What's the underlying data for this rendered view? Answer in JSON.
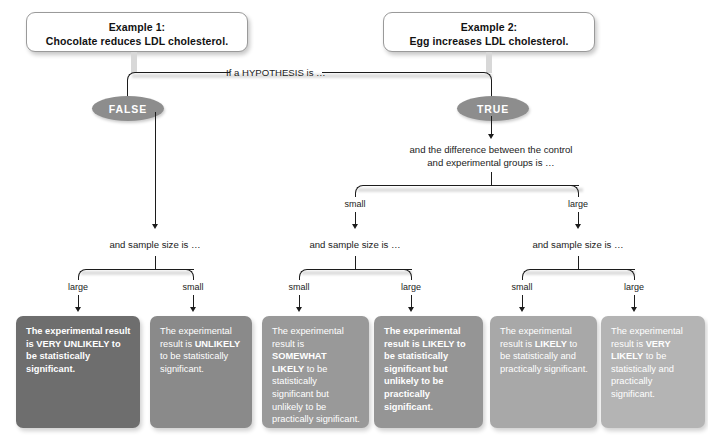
{
  "diagram": {
    "examples": [
      {
        "id": "example-1",
        "line1": "Example 1:",
        "line2": "Chocolate reduces LDL cholesterol."
      },
      {
        "id": "example-2",
        "line1": "Example 2:",
        "line2": "Egg increases LDL cholesterol."
      }
    ],
    "root_question": "If a HYPOTHESIS is …",
    "decisions": [
      {
        "id": "false-node",
        "label": "FALSE",
        "color": "#8d8d8d"
      },
      {
        "id": "true-node",
        "label": "TRUE",
        "color": "#8d8d8d"
      }
    ],
    "difference_question_line1": "and the difference between the control",
    "difference_question_line2": "and experimental groups is …",
    "difference_branches": [
      {
        "id": "difference-small",
        "label": "small"
      },
      {
        "id": "difference-large",
        "label": "large"
      }
    ],
    "sample_size_question": "and sample size is …",
    "sample_size_questions": [
      {
        "id": "sample-size-false",
        "label": "and sample size is …"
      },
      {
        "id": "sample-size-small-diff",
        "label": "and sample size is …"
      },
      {
        "id": "sample-size-large-diff",
        "label": "and sample size is …"
      }
    ],
    "sample_branches": [
      {
        "id": "false-large",
        "label": "large"
      },
      {
        "id": "false-small",
        "label": "small"
      },
      {
        "id": "smalldiff-small",
        "label": "small"
      },
      {
        "id": "smalldiff-large",
        "label": "large"
      },
      {
        "id": "largediff-small",
        "label": "small"
      },
      {
        "id": "largediff-large",
        "label": "large"
      }
    ],
    "results": [
      {
        "id": "result-very-unlikely",
        "color": "#6e6e6e",
        "segments": [
          {
            "text": "The experimental result is VERY UNLIKELY ",
            "bold": true
          },
          {
            "text": "to be statistically significant.",
            "bold": true
          }
        ],
        "plain": "The experimental result is VERY UNLIKELY to be statistically significant."
      },
      {
        "id": "result-unlikely",
        "color": "#8a8a8a",
        "segments": [
          {
            "text": "The experimental result is ",
            "bold": false
          },
          {
            "text": "UNLIKELY",
            "bold": true
          },
          {
            "text": " to be statistically significant.",
            "bold": false
          }
        ],
        "plain": "The experimental result is UNLIKELY to be statistically significant."
      },
      {
        "id": "result-somewhat-likely",
        "color": "#999999",
        "segments": [
          {
            "text": "The experimental result is ",
            "bold": false
          },
          {
            "text": "SOMEWHAT LIKELY",
            "bold": true
          },
          {
            "text": " to be statistically significant but unlikely to be practically significant.",
            "bold": false
          }
        ],
        "plain": "The experimental result is SOMEWHAT LIKELY to be statistically significant but unlikely to be practically significant."
      },
      {
        "id": "result-likely-not-practical",
        "color": "#959595",
        "segments": [
          {
            "text": "The experimental result is LIKELY to be statistically significant but unlikely to be practically significant.",
            "bold": true
          }
        ],
        "plain": "The experimental result is LIKELY to be statistically significant but unlikely to be practically significant."
      },
      {
        "id": "result-likely-both",
        "color": "#a8a8a8",
        "segments": [
          {
            "text": "The experimental result is ",
            "bold": false
          },
          {
            "text": "LIKELY",
            "bold": true
          },
          {
            "text": " to be statistically and practically significant.",
            "bold": false
          }
        ],
        "plain": "The experimental result is LIKELY to be statistically and practically significant."
      },
      {
        "id": "result-very-likely-both",
        "color": "#b4b4b4",
        "segments": [
          {
            "text": "The experimental result is ",
            "bold": false
          },
          {
            "text": "VERY LIKELY",
            "bold": true
          },
          {
            "text": " to be statistically and practically significant.",
            "bold": false
          }
        ],
        "plain": "The experimental result is VERY LIKELY to be statistically and practically significant."
      }
    ]
  }
}
